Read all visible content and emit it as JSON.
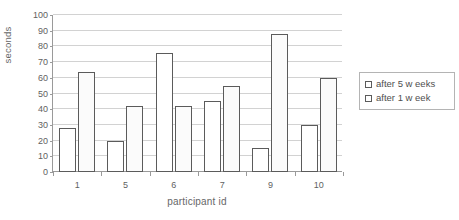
{
  "chart_data": {
    "type": "bar",
    "title": "",
    "subtitle": "",
    "xlabel": "participant id",
    "ylabel": "seconds",
    "categories": [
      "1",
      "5",
      "6",
      "7",
      "9",
      "10"
    ],
    "series": [
      {
        "name": "after 5 w eeks",
        "values": [
          28,
          20,
          76,
          45,
          15,
          30
        ]
      },
      {
        "name": "after 1 w eek",
        "values": [
          64,
          42,
          42,
          55,
          88,
          60
        ]
      }
    ],
    "ylim": [
      0,
      100
    ],
    "ytick_step": 10,
    "yticks": [
      0,
      10,
      20,
      30,
      40,
      50,
      60,
      70,
      80,
      90,
      100
    ],
    "ytick_labels": [
      "0",
      "10",
      "20",
      "30",
      "40",
      "50",
      "60",
      "70",
      "80",
      "90",
      "100"
    ],
    "grid": "horizontal",
    "legend_position": "right",
    "colors": {
      "bar_fill": "#ffffff",
      "bar_outline": "#5b5b5b",
      "gridline": "#d2d2d2",
      "axis": "#9a9a9a",
      "text": "#5f5f5f",
      "legend_border": "#b4b4b4",
      "background": "#ffffff"
    }
  },
  "legend": {
    "items": [
      {
        "label": "after 5 w eeks"
      },
      {
        "label": "after 1 w eek"
      }
    ]
  }
}
